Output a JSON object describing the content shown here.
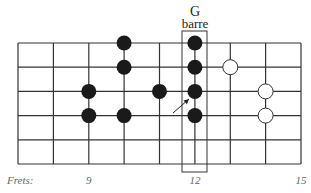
{
  "title": {
    "chord": "G",
    "subtitle": "barre"
  },
  "grid": {
    "fret_lines_x": [
      18,
      53.4,
      88.8,
      124.1,
      159.5,
      194.9,
      230.3,
      265.6,
      301
    ],
    "string_lines_y": [
      43,
      67.2,
      91.4,
      115.6,
      139.8,
      164
    ],
    "line_color": "#333333"
  },
  "barre_box": {
    "x": 182,
    "y": 31,
    "width": 25,
    "height": 141
  },
  "dots": {
    "filled": [
      {
        "fret_index": 3,
        "string_index": 0
      },
      {
        "fret_index": 3,
        "string_index": 1
      },
      {
        "fret_index": 2,
        "string_index": 2
      },
      {
        "fret_index": 2,
        "string_index": 3
      },
      {
        "fret_index": 3,
        "string_index": 3
      },
      {
        "fret_index": 4,
        "string_index": 2
      },
      {
        "fret_index": 5,
        "string_index": 0
      },
      {
        "fret_index": 5,
        "string_index": 1
      },
      {
        "fret_index": 5,
        "string_index": 2
      },
      {
        "fret_index": 5,
        "string_index": 3
      }
    ],
    "open": [
      {
        "fret_index": 6,
        "string_index": 1
      },
      {
        "fret_index": 7,
        "string_index": 2
      },
      {
        "fret_index": 7,
        "string_index": 3
      }
    ],
    "filled_color": "#1a1a1a",
    "open_fill": "#ffffff",
    "radius": 7.5
  },
  "arrow": {
    "from": [
      173,
      113
    ],
    "to": [
      189,
      99
    ]
  },
  "fret_labels": {
    "prefix": "Frets:",
    "markers": [
      {
        "label": "9",
        "fret_index": 2
      },
      {
        "label": "12",
        "fret_index": 5
      },
      {
        "label": "15",
        "fret_index": 8
      }
    ]
  }
}
